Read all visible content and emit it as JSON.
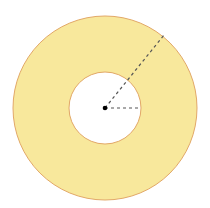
{
  "diagram": {
    "type": "annulus",
    "center": {
      "x": 105,
      "y": 108
    },
    "outer_radius": 92,
    "inner_radius": 36,
    "fill_color": "#F8E89C",
    "stroke_color": "#E2A868",
    "background_color": "#FFFFFF",
    "center_point_color": "#000000",
    "dash_color": "#555555",
    "radius_lines": [
      {
        "name": "outer-radius-line",
        "to": {
          "x": 164,
          "y": 35
        }
      },
      {
        "name": "inner-radius-line",
        "to": {
          "x": 141,
          "y": 108
        }
      }
    ]
  }
}
